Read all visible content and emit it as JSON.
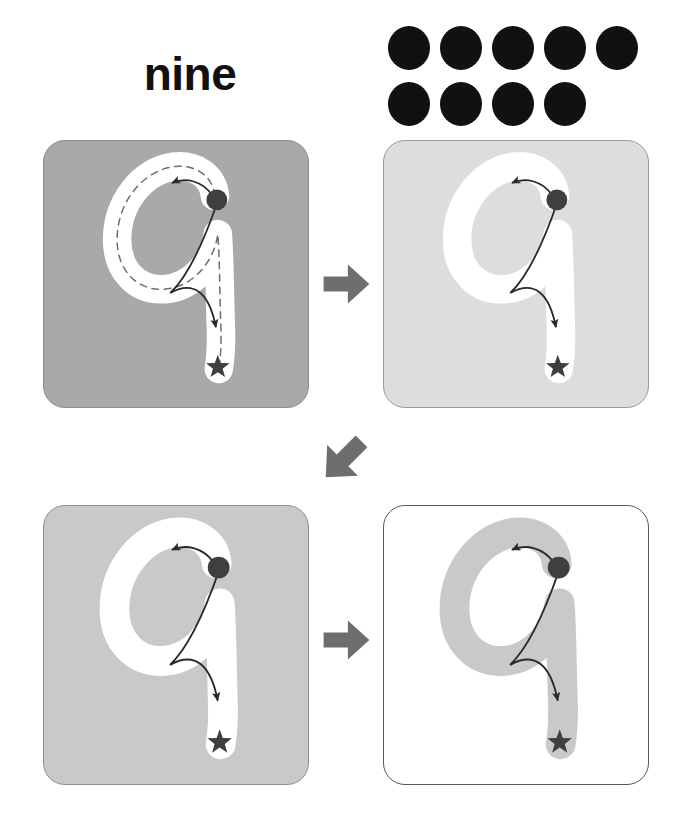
{
  "header": {
    "word_label": "nine",
    "count": 9,
    "dot_rows": [
      5,
      4
    ],
    "dot_color": "#111111",
    "dot_icon_name": "counting-dot"
  },
  "glyph": {
    "character": "9",
    "start_marker_name": "start-dot-marker",
    "end_marker_name": "end-star-marker",
    "start_marker_color": "#3f3f3f",
    "end_marker_color": "#3f3f3f",
    "direction_arrow_color": "#2a2a2a"
  },
  "panels": [
    {
      "id": "panel-1",
      "step": 1,
      "label": "trace-with-guide",
      "background": "#a9a9a9",
      "border": "#8a8a8a",
      "stroke_color": "#ffffff",
      "guide_dashes": true,
      "guide_color": "#6e6e6e"
    },
    {
      "id": "panel-2",
      "step": 2,
      "label": "trace-no-guide-light",
      "background": "#dddddd",
      "border": "#9a9a9a",
      "stroke_color": "#ffffff",
      "guide_dashes": false,
      "guide_color": ""
    },
    {
      "id": "panel-3",
      "step": 3,
      "label": "trace-no-guide-medium",
      "background": "#c9c9c9",
      "border": "#8f8f8f",
      "stroke_color": "#ffffff",
      "guide_dashes": false,
      "guide_color": ""
    },
    {
      "id": "panel-4",
      "step": 4,
      "label": "write-on-white",
      "background": "#ffffff",
      "border": "#5a5a5a",
      "stroke_color": "#c9c9c9",
      "guide_dashes": false,
      "guide_color": ""
    }
  ],
  "step_arrows": [
    {
      "id": "arrow-1",
      "direction": "right",
      "color": "#6e6e6e",
      "from": "panel-1",
      "to": "panel-2"
    },
    {
      "id": "arrow-2",
      "direction": "down-left",
      "color": "#6e6e6e",
      "from": "panel-2",
      "to": "panel-3"
    },
    {
      "id": "arrow-3",
      "direction": "right",
      "color": "#6e6e6e",
      "from": "panel-3",
      "to": "panel-4"
    }
  ]
}
